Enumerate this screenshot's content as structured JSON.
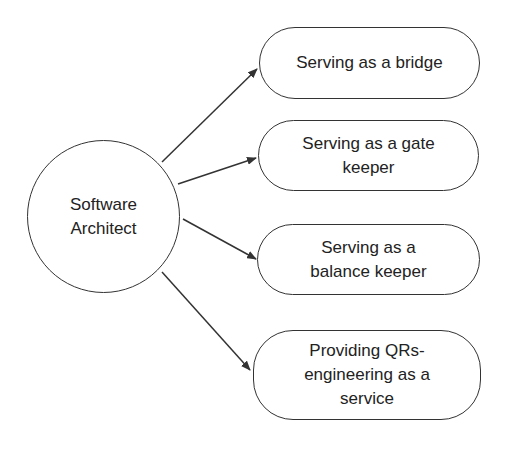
{
  "diagram": {
    "center": {
      "label_line1": "Software",
      "label_line2": "Architect"
    },
    "roles": [
      {
        "lines": [
          "Serving as a bridge"
        ]
      },
      {
        "lines": [
          "Serving as a gate",
          "keeper"
        ]
      },
      {
        "lines": [
          "Serving as a",
          "balance keeper"
        ]
      },
      {
        "lines": [
          "Providing QRs-",
          "engineering as a",
          "service"
        ]
      }
    ],
    "edges": [
      {
        "from": "Software Architect",
        "to": "Serving as a bridge"
      },
      {
        "from": "Software Architect",
        "to": "Serving as a gate keeper"
      },
      {
        "from": "Software Architect",
        "to": "Serving as a balance keeper"
      },
      {
        "from": "Software Architect",
        "to": "Providing QRs-engineering as a service"
      }
    ],
    "colors": {
      "stroke": "#333333",
      "background": "#ffffff",
      "text": "#222222"
    }
  }
}
